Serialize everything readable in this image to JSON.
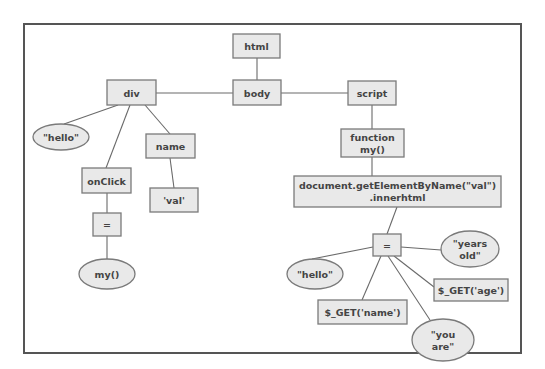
{
  "diagram": {
    "type": "parse-tree",
    "nodes": {
      "html": {
        "label": "html",
        "shape": "box"
      },
      "body": {
        "label": "body",
        "shape": "box"
      },
      "div": {
        "label": "div",
        "shape": "box"
      },
      "script": {
        "label": "script",
        "shape": "box"
      },
      "div_hello": {
        "label": "\"hello\"",
        "shape": "ellipse"
      },
      "onclick": {
        "label": "onClick",
        "shape": "box"
      },
      "name": {
        "label": "name",
        "shape": "box"
      },
      "val": {
        "label": "'val'",
        "shape": "box"
      },
      "onclick_eq": {
        "label": "=",
        "shape": "box"
      },
      "my_call": {
        "label": "my()",
        "shape": "ellipse"
      },
      "function_my": {
        "line1": "function",
        "line2": "my()",
        "shape": "box"
      },
      "document": {
        "line1": "document.getElementByName(\"val\")",
        "line2": ".innerhtml",
        "shape": "box"
      },
      "assign_eq": {
        "label": "=",
        "shape": "box"
      },
      "hello2": {
        "label": "\"hello\"",
        "shape": "ellipse"
      },
      "years_old": {
        "line1": "\"years",
        "line2": "old\"",
        "shape": "ellipse"
      },
      "get_age": {
        "label": "$_GET('age')",
        "shape": "box"
      },
      "get_name": {
        "label": "$_GET('name')",
        "shape": "box"
      },
      "you_are": {
        "line1": "\"you",
        "line2": "are\"",
        "shape": "ellipse"
      }
    },
    "edges": [
      [
        "html",
        "body"
      ],
      [
        "body",
        "div"
      ],
      [
        "body",
        "script"
      ],
      [
        "div",
        "div_hello"
      ],
      [
        "div",
        "onclick"
      ],
      [
        "div",
        "name"
      ],
      [
        "name",
        "val"
      ],
      [
        "onclick",
        "onclick_eq"
      ],
      [
        "onclick_eq",
        "my_call"
      ],
      [
        "script",
        "function_my"
      ],
      [
        "function_my",
        "document"
      ],
      [
        "document",
        "assign_eq"
      ],
      [
        "assign_eq",
        "hello2"
      ],
      [
        "assign_eq",
        "years_old"
      ],
      [
        "assign_eq",
        "get_age"
      ],
      [
        "assign_eq",
        "get_name"
      ],
      [
        "assign_eq",
        "you_are"
      ]
    ]
  }
}
